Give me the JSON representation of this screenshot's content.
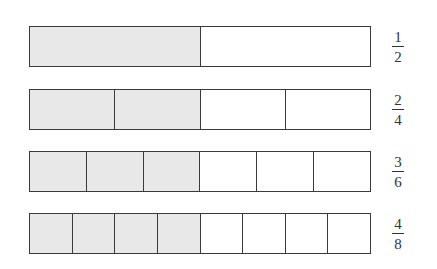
{
  "diagram": {
    "shade_color": "#e8e8e8",
    "line_color": "#3a3a3a",
    "bars": [
      {
        "numerator": "1",
        "denominator": "2",
        "parts": 2,
        "shaded": 1,
        "top": 26
      },
      {
        "numerator": "2",
        "denominator": "4",
        "parts": 4,
        "shaded": 2,
        "top": 89
      },
      {
        "numerator": "3",
        "denominator": "6",
        "parts": 6,
        "shaded": 3,
        "top": 151
      },
      {
        "numerator": "4",
        "denominator": "8",
        "parts": 8,
        "shaded": 4,
        "top": 213
      }
    ]
  }
}
